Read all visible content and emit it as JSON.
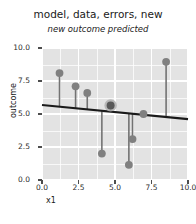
{
  "chart_data": {
    "type": "scatter",
    "title": "model, data, errors, new",
    "subtitle": "new outcome predicted",
    "xlabel": "x1",
    "ylabel": "outcome",
    "xlim": [
      0,
      10
    ],
    "ylim": [
      0,
      10
    ],
    "x_ticks": [
      "0.0",
      "2.5",
      "5.0",
      "7.5",
      "10.0"
    ],
    "x_tick_values": [
      0,
      2.5,
      5,
      7.5,
      10
    ],
    "y_ticks": [
      "0.0",
      "2.5",
      "5.0",
      "7.5",
      "10.0"
    ],
    "y_tick_values": [
      0,
      2.5,
      5,
      7.5,
      10
    ],
    "grid": true,
    "legend": "none",
    "panel_background": "#e3e3e3",
    "grid_color": "#ffffff",
    "point_color": "#808080",
    "highlight_point_color": "#595959",
    "highlight_halo_color": "#b0b0b0",
    "error_segment_color": "#737373",
    "model_line_color": "#1a1a1a",
    "points": [
      {
        "x": 1.2,
        "y": 8.1,
        "fitted": 5.55,
        "highlight": false
      },
      {
        "x": 2.3,
        "y": 7.1,
        "fitted": 5.43,
        "highlight": false
      },
      {
        "x": 3.1,
        "y": 6.6,
        "fitted": 5.35,
        "highlight": false
      },
      {
        "x": 4.1,
        "y": 2.0,
        "fitted": 5.24,
        "highlight": false
      },
      {
        "x": 4.7,
        "y": 5.65,
        "fitted": 5.18,
        "highlight": true
      },
      {
        "x": 5.95,
        "y": 1.15,
        "fitted": 5.05,
        "highlight": false
      },
      {
        "x": 6.2,
        "y": 3.1,
        "fitted": 5.02,
        "highlight": false
      },
      {
        "x": 6.95,
        "y": 5.0,
        "fitted": 4.94,
        "highlight": false
      },
      {
        "x": 8.5,
        "y": 8.95,
        "fitted": 4.78,
        "highlight": false
      }
    ],
    "model_line": {
      "intercept": 5.68,
      "slope": -0.107,
      "x_start": 0,
      "x_end": 10
    }
  }
}
